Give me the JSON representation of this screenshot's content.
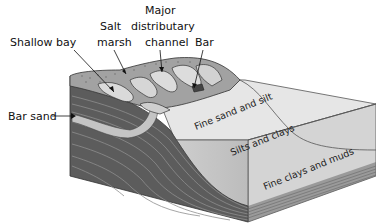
{
  "diagram": {
    "type": "delta-block-cross-section",
    "labels": {
      "shallow_bay": "Shallow bay",
      "salt_marsh_line1": "Salt",
      "salt_marsh_line2": "marsh",
      "major_channel_line1": "Major",
      "major_channel_line2": "distributary",
      "major_channel_line3": "channel",
      "bar": "Bar",
      "bar_sand": "Bar sand",
      "fine_sand_silt": "Fine sand and silt",
      "silts_clays": "Silts and clays",
      "fine_clays_muds": "Fine clays and muds"
    },
    "colors": {
      "background": "#ffffff",
      "top_land": "#9a9a9a",
      "marsh": "#b0b0b0",
      "water_light": "#dcdcdc",
      "sea_surface": "#e4e4e4",
      "front_dark": "#5a5a5a",
      "strata_line": "#8c8c8c",
      "bar_sand": "#c8c8c8",
      "outline": "#333333"
    }
  }
}
